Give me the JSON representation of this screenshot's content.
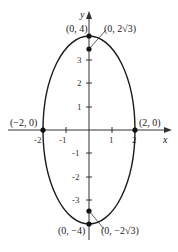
{
  "diagram": {
    "type": "ellipse-graph",
    "equation_shape": "vertical ellipse centered at origin",
    "axes": {
      "x_label": "x",
      "y_label": "y",
      "x_ticks": [
        "-2",
        "-1",
        "1",
        "2"
      ],
      "y_ticks": [
        "3",
        "2",
        "1",
        "-1",
        "-2",
        "-3"
      ]
    },
    "points": {
      "top_vertex": "(0, 4)",
      "top_focus": "(0, 2√3)",
      "left_vertex": "(−2, 0)",
      "right_vertex": "(2, 0)",
      "bottom_vertex": "(0, −4)",
      "bottom_focus": "(0, −2√3)"
    },
    "colors": {
      "curve": "#1a1a1a",
      "axes": "#333333",
      "background": "#ffffff"
    }
  }
}
